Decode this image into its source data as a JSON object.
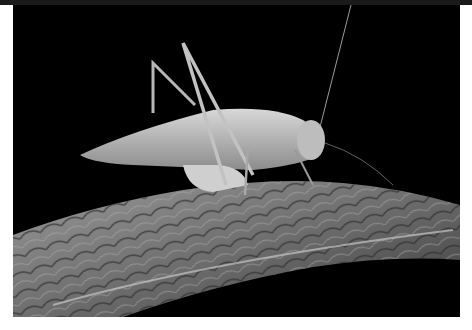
{
  "image": {
    "description": "Grayscale macro photograph of a katydid (bush cricket) perched on a textured, veined leaf against a black background",
    "subject": "katydid",
    "surface": "leaf",
    "background_color": "#000000",
    "frame_color": "#ffffff"
  }
}
